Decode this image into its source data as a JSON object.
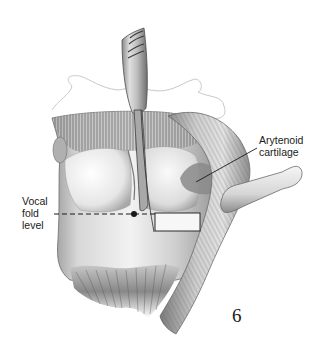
{
  "figure": {
    "number": "6",
    "labels": {
      "arytenoid": {
        "lines": [
          "Arytenoid",
          "cartilage"
        ],
        "text": "Arytenoid cartilage"
      },
      "vocal_fold_level": {
        "lines": [
          "Vocal",
          "fold",
          "level"
        ],
        "text": "Vocal fold level"
      }
    },
    "annotations": {
      "vocal_fold_line": "dashed",
      "marker": "dot",
      "incision_box": "rectangle"
    },
    "colors": {
      "ink": "#1a1a1a",
      "tissue_light": "#e8e8e8",
      "tissue_mid": "#b5b5b5",
      "tissue_dark": "#5a5a5a",
      "arytenoid_shade": "#8a8a8a",
      "background": "#ffffff"
    }
  }
}
